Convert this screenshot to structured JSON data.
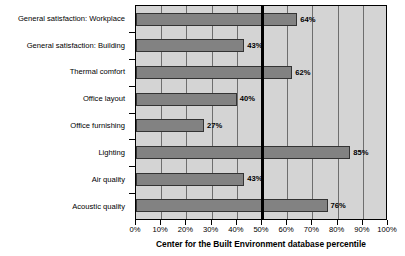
{
  "chart_data": {
    "type": "bar",
    "orientation": "horizontal",
    "title": "",
    "xlabel": "Center for the Built Environment database percentile",
    "ylabel": "",
    "xlim": [
      0,
      100
    ],
    "xticks": [
      "0%",
      "10%",
      "20%",
      "30%",
      "40%",
      "50%",
      "60%",
      "70%",
      "80%",
      "90%",
      "100%"
    ],
    "xtick_values": [
      0,
      10,
      20,
      30,
      40,
      50,
      60,
      70,
      80,
      90,
      100
    ],
    "grid": true,
    "legend": "none",
    "categories": [
      "General satisfaction: Workplace",
      "General satisfaction: Building",
      "Thermal comfort",
      "Office layout",
      "Office furnishing",
      "Lighting",
      "Air quality",
      "Acoustic quality"
    ],
    "values": [
      64,
      43,
      62,
      40,
      27,
      85,
      43,
      76
    ],
    "data_labels": [
      "64%",
      "43%",
      "62%",
      "40%",
      "27%",
      "85%",
      "43%",
      "76%"
    ],
    "reference_line": {
      "value": 50,
      "label": "50th percentile",
      "color": "#000000"
    },
    "colors": {
      "bar_fill": "#828282",
      "bar_border": "#333333",
      "plot_background": "#d4d4d4",
      "gridline": "#6e6e6e",
      "axis": "#000000"
    }
  }
}
